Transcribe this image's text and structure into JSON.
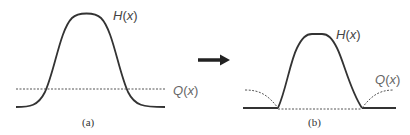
{
  "figure": {
    "panel_a": {
      "caption": "(a)",
      "curve_label": "H(x)",
      "curve_label_main": "H",
      "curve_label_arg": "x",
      "line_label": "Q(x)",
      "line_label_main": "Q",
      "line_label_arg": "x"
    },
    "panel_b": {
      "caption": "(b)",
      "curve_label": "H(x)",
      "curve_label_main": "H",
      "curve_label_arg": "x",
      "line_label": "Q(x)",
      "line_label_main": "Q",
      "line_label_arg": "x"
    },
    "arrow": "transformation-arrow",
    "colors": {
      "curve": "#333333",
      "dotted": "#555555",
      "arrow": "#222222"
    }
  }
}
